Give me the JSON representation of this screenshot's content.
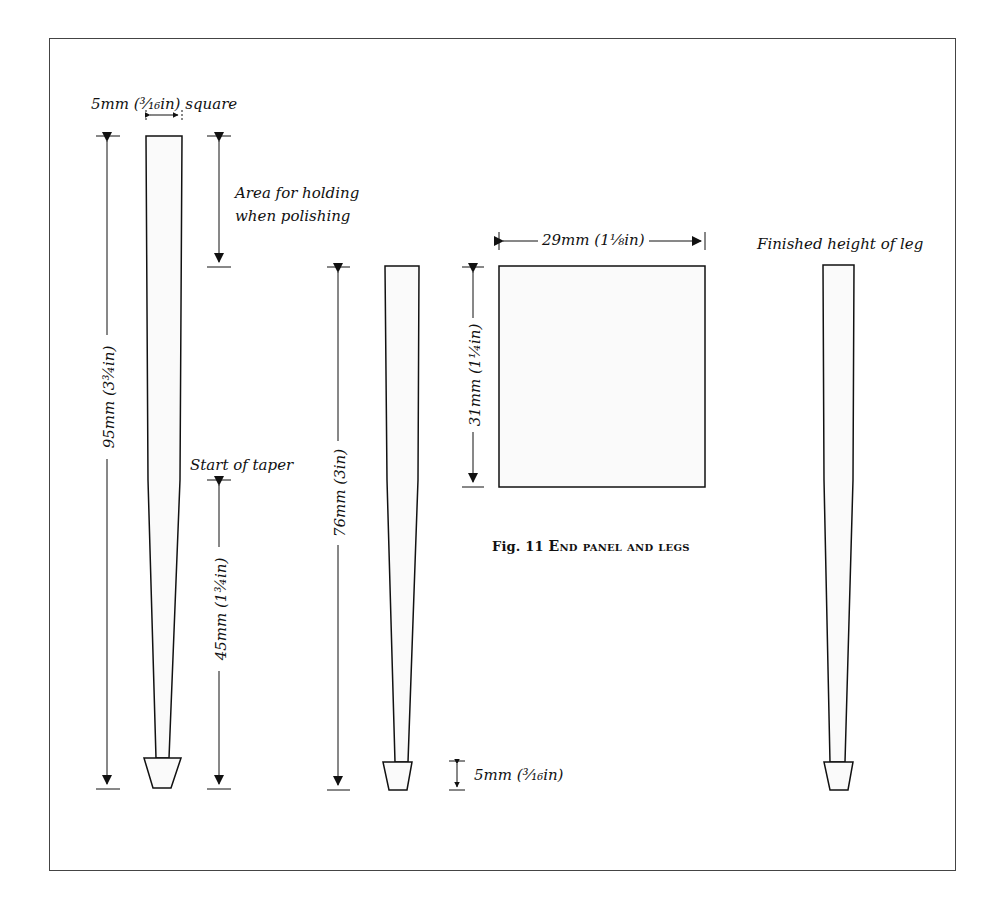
{
  "figure": {
    "caption_number": "Fig. 11",
    "caption_title": "End panel and legs"
  },
  "labels": {
    "top_width": "5mm (³⁄₁₆in) square",
    "holding_area_line1": "Area for holding",
    "holding_area_line2": "when polishing",
    "start_of_taper": "Start of taper",
    "finished_height": "Finished height of leg",
    "overall_length": "95mm (3¾in)",
    "taper_length": "45mm (1¾in)",
    "finished_length": "76mm (3in)",
    "foot_height": "5mm (³⁄₁₆in)",
    "panel_width": "29mm (1⅛in)",
    "panel_height": "31mm (1¼in)"
  },
  "components": [
    {
      "name": "rough leg",
      "length_mm": 95,
      "top_section_mm": 5
    },
    {
      "name": "turned leg",
      "length_mm": 76
    },
    {
      "name": "end panel",
      "width_mm": 29,
      "height_mm": 31
    },
    {
      "name": "finished leg",
      "length_mm": 76
    }
  ],
  "colors": {
    "line": "#111111",
    "fill": "#fafafa",
    "frame": "#444444"
  }
}
